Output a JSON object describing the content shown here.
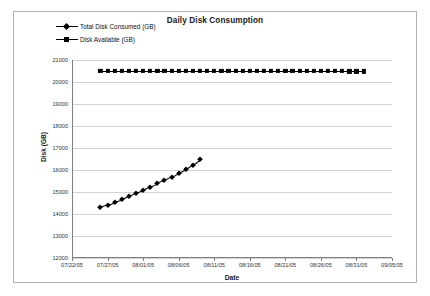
{
  "chart_data": {
    "type": "line",
    "title": "Daily Disk Consumption",
    "xlabel": "Date",
    "ylabel": "Disk (GB)",
    "ylim": [
      12000,
      21000
    ],
    "y_ticks": [
      12000,
      13000,
      14000,
      15000,
      16000,
      17000,
      18000,
      19000,
      20000,
      21000
    ],
    "y_tick_labels": [
      "12000",
      "13000",
      "14000",
      "15000",
      "16000",
      "17000",
      "18000",
      "19000",
      "20000",
      "21000"
    ],
    "xlim": [
      "07/22/05",
      "09/05/05"
    ],
    "x_ticks": [
      "07/22/05",
      "07/27/05",
      "08/01/05",
      "08/06/05",
      "08/11/05",
      "08/16/05",
      "08/21/05",
      "08/26/05",
      "08/31/05",
      "09/05/05"
    ],
    "grid": "horizontal",
    "legend_position": "top-left",
    "series": [
      {
        "name": "Total Disk Consumed (GB)",
        "marker": "diamond",
        "color": "#000000",
        "x": [
          "07/26/05",
          "07/27/05",
          "07/28/05",
          "07/29/05",
          "07/30/05",
          "07/31/05",
          "08/01/05",
          "08/02/05",
          "08/03/05",
          "08/04/05",
          "08/05/05",
          "08/06/05",
          "08/07/05",
          "08/08/05",
          "08/09/05"
        ],
        "values": [
          14300,
          14420,
          14540,
          14660,
          14800,
          14950,
          15080,
          15250,
          15400,
          15550,
          15700,
          15880,
          16050,
          16250,
          16480
        ]
      },
      {
        "name": "Disk Available (GB)",
        "marker": "square",
        "color": "#000000",
        "x": [
          "07/26/05",
          "07/27/05",
          "07/28/05",
          "07/29/05",
          "07/30/05",
          "07/31/05",
          "08/01/05",
          "08/02/05",
          "08/03/05",
          "08/04/05",
          "08/05/05",
          "08/06/05",
          "08/07/05",
          "08/08/05",
          "08/09/05",
          "08/10/05",
          "08/11/05",
          "08/12/05",
          "08/13/05",
          "08/14/05",
          "08/15/05",
          "08/16/05",
          "08/17/05",
          "08/18/05",
          "08/19/05",
          "08/20/05",
          "08/21/05",
          "08/22/05",
          "08/23/05",
          "08/24/05",
          "08/25/05",
          "08/26/05",
          "08/27/05",
          "08/28/05",
          "08/29/05",
          "08/30/05",
          "08/31/05",
          "09/01/05"
        ],
        "values": [
          20520,
          20520,
          20520,
          20520,
          20520,
          20520,
          20520,
          20520,
          20520,
          20520,
          20515,
          20515,
          20515,
          20515,
          20515,
          20515,
          20510,
          20510,
          20510,
          20510,
          20510,
          20505,
          20505,
          20505,
          20505,
          20500,
          20500,
          20500,
          20500,
          20495,
          20495,
          20495,
          20490,
          20490,
          20490,
          20485,
          20485,
          20480
        ]
      }
    ]
  },
  "legend": {
    "entries": [
      {
        "label": "Total Disk Consumed (GB)",
        "marker": "diamond"
      },
      {
        "label": "Disk Available (GB)",
        "marker": "square"
      }
    ]
  }
}
